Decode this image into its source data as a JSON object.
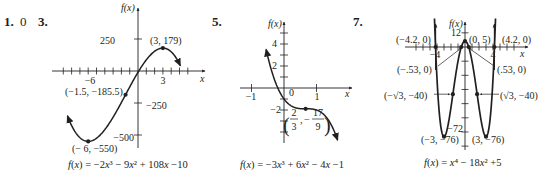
{
  "problems": [
    {
      "number": "1.",
      "answer": "0"
    },
    {
      "number": "3."
    },
    {
      "number": "5."
    },
    {
      "number": "7."
    }
  ],
  "chart_data": [
    {
      "type": "line",
      "id": "problem-3",
      "title": "",
      "equation": "f(x) = −2x³ − 9x² + 108x −10",
      "xlabel": "x",
      "ylabel": "f(x)",
      "x_ticks": [
        {
          "value": -6,
          "label": "−6"
        },
        {
          "value": 3,
          "label": "3"
        }
      ],
      "y_ticks": [
        {
          "value": 250,
          "label": "250"
        },
        {
          "value": -250,
          "label": "−250"
        },
        {
          "value": -500,
          "label": "−500"
        }
      ],
      "xlim": [
        -9.5,
        6
      ],
      "ylim": [
        -600,
        300
      ],
      "x_minor_step": 1,
      "domain": [
        -8.5,
        5.1
      ],
      "coefficients": [
        -2,
        -9,
        108,
        -10
      ],
      "points": [
        {
          "x": 3,
          "y": 179,
          "label": "(3, 179)"
        },
        {
          "x": -1.5,
          "y": -185.5,
          "label": "(−1.5, −185.5)"
        },
        {
          "x": -6,
          "y": -550,
          "label": "(− 6, −550)"
        }
      ]
    },
    {
      "type": "line",
      "id": "problem-5",
      "title": "",
      "equation": "f(x) = −3x³ + 6x² − 4x −1",
      "xlabel": "x",
      "ylabel": "f(x)",
      "x_ticks": [
        {
          "value": -1,
          "label": "−1"
        },
        {
          "value": 0,
          "label": "0"
        },
        {
          "value": 1,
          "label": "1"
        }
      ],
      "y_ticks": [
        {
          "value": 4,
          "label": "4"
        },
        {
          "value": 2,
          "label": "2"
        },
        {
          "value": -2,
          "label": "−2"
        }
      ],
      "xlim": [
        -1.3,
        1.5
      ],
      "ylim": [
        -4.8,
        5.5
      ],
      "domain": [
        -0.55,
        1.65
      ],
      "coefficients": [
        -3,
        6,
        -4,
        -1
      ],
      "points": [
        {
          "x": 0.6667,
          "y": -1.8889,
          "label_num_x": "2",
          "label_den_x": "3",
          "label_num_y": "17",
          "label_den_y": "9",
          "label_sign_y": "−"
        }
      ]
    },
    {
      "type": "line",
      "id": "problem-7",
      "title": "",
      "equation": "f(x) = x⁴ − 18x² +5",
      "xlabel": "x",
      "ylabel": "f(x)",
      "x_ticks": [
        {
          "value": -4,
          "label": "−4"
        },
        {
          "value": 4,
          "label": "4"
        }
      ],
      "y_ticks": [
        {
          "value": 12,
          "label": "12"
        },
        {
          "value": -72,
          "label": "−72"
        }
      ],
      "xlim": [
        -7,
        7.5
      ],
      "ylim": [
        -84,
        22
      ],
      "x_minor_step": 1,
      "y_minor_step": 12,
      "domain": [
        -4.36,
        4.36
      ],
      "coefficients": [
        1,
        0,
        -18,
        0,
        5
      ],
      "points": [
        {
          "x": -4.2,
          "y": 0,
          "label": "(−4.2, 0)"
        },
        {
          "x": 0,
          "y": 5,
          "label": "(0, 5)"
        },
        {
          "x": 4.2,
          "y": 0,
          "label": "(4.2, 0)"
        },
        {
          "x": -0.53,
          "y": 0,
          "label": "(−.53, 0)"
        },
        {
          "x": 0.53,
          "y": 0,
          "label": "(.53, 0)"
        },
        {
          "x": -1.732,
          "y": -40,
          "label": "(−√3, −40)"
        },
        {
          "x": 1.732,
          "y": -40,
          "label": "(√3, −40)"
        },
        {
          "x": -3,
          "y": -76,
          "label": "(−3, −76)"
        },
        {
          "x": 3,
          "y": -76,
          "label": "(3, −76)"
        }
      ]
    }
  ]
}
